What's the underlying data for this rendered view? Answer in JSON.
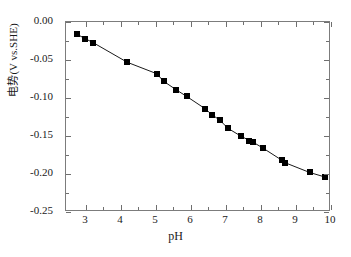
{
  "chart_data": {
    "type": "line",
    "title": "",
    "xlabel": "pH",
    "ylabel": "电势(V vs.SHE)",
    "xlim": [
      2.43,
      10.0
    ],
    "ylim": [
      -0.25,
      0.0
    ],
    "xticks": [
      "3",
      "4",
      "5",
      "6",
      "7",
      "8",
      "9",
      "10"
    ],
    "xtick_values": [
      3,
      4,
      5,
      6,
      7,
      8,
      9,
      10
    ],
    "yticks": [
      "0.00",
      "-0.05",
      "-0.10",
      "-0.15",
      "-0.20",
      "-0.25"
    ],
    "ytick_values": [
      0.0,
      -0.05,
      -0.1,
      -0.15,
      -0.2,
      -0.25
    ],
    "grid": false,
    "legend": null,
    "marker": "filled-square",
    "marker_color": "#000000",
    "line_color": "#000000",
    "series": [
      {
        "name": "电势 vs pH",
        "x": [
          2.74,
          2.98,
          3.2,
          4.18,
          5.02,
          5.22,
          5.57,
          5.88,
          6.4,
          6.6,
          6.82,
          7.06,
          7.42,
          7.67,
          7.77,
          8.06,
          8.6,
          8.68,
          9.39,
          9.83
        ],
        "y": [
          -0.016,
          -0.022,
          -0.027,
          -0.053,
          -0.068,
          -0.078,
          -0.089,
          -0.098,
          -0.114,
          -0.122,
          -0.129,
          -0.14,
          -0.15,
          -0.156,
          -0.158,
          -0.166,
          -0.182,
          -0.185,
          -0.198,
          -0.204
        ]
      }
    ]
  },
  "axes": {
    "x_title": "pH",
    "y_title": "电势(V vs.SHE)"
  }
}
